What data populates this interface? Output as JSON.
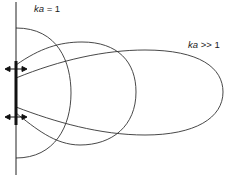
{
  "diagram": {
    "labels": {
      "low": {
        "var": "ka",
        "rel": " = 1"
      },
      "high": {
        "var": "ka",
        "rel": " >> 1"
      }
    },
    "colors": {
      "line": "#333333",
      "bar": "#111111",
      "background": "#ffffff"
    },
    "elements": {
      "axis": {
        "x": 16,
        "y1": 2,
        "y2": 175
      },
      "source_bar": {
        "x": 16,
        "y1": 61,
        "y2": 125
      },
      "arrows_y": [
        69,
        117
      ],
      "curves": [
        {
          "name": "ka = 1 pattern",
          "shape": "semicircle",
          "top": 28,
          "bottom": 158,
          "right_x": 71
        },
        {
          "name": "intermediate lobe",
          "shape": "lobe",
          "left_top": 65,
          "left_bottom": 113,
          "right_x": 136,
          "top_y": 42,
          "bottom_y": 145
        },
        {
          "name": "ka >> 1 lobe",
          "shape": "lobe",
          "left_top": 78,
          "left_bottom": 107,
          "right_x": 223,
          "top_y": 50,
          "bottom_y": 135
        }
      ]
    }
  }
}
